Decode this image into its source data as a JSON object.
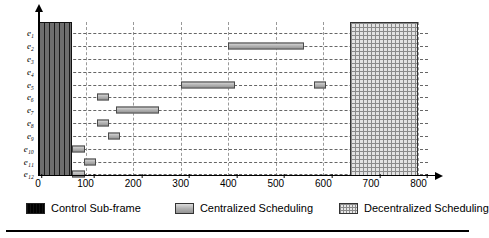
{
  "chart_data": {
    "type": "bar",
    "subtype": "horizontal-gantt",
    "title": "",
    "xlabel": "",
    "ylabel": "",
    "xlim": [
      0,
      820
    ],
    "ylim_categories": 12,
    "grid": true,
    "grid_style": "dashed",
    "legend_position": "bottom",
    "xticks": [
      0,
      100,
      200,
      300,
      400,
      500,
      600,
      700,
      800
    ],
    "xtick_labels": [
      "0",
      "100",
      "200",
      "300",
      "400",
      "500",
      "600",
      "700",
      "800"
    ],
    "categories": [
      "e1",
      "e2",
      "e3",
      "e4",
      "e5",
      "e6",
      "e7",
      "e8",
      "e9",
      "e10",
      "e11",
      "e12"
    ],
    "category_labels": [
      "e₁",
      "e₂",
      "e₃",
      "e₄",
      "e₅",
      "e₆",
      "e₇",
      "e₈",
      "e₉",
      "e₁₀",
      "e₁₁",
      "e₁₂"
    ],
    "series": [
      {
        "name": "Control Sub-frame",
        "style": "control",
        "color": "#1a1a1a",
        "spans_all_rows": true,
        "intervals": [
          {
            "start": 0,
            "end": 72
          }
        ]
      },
      {
        "name": "Centralized Scheduling",
        "style": "centralized",
        "color": "#a8a8a8",
        "spans_all_rows": false,
        "bars": [
          {
            "row": "e1",
            "intervals": []
          },
          {
            "row": "e2",
            "intervals": [
              {
                "start": 400,
                "end": 560
              }
            ]
          },
          {
            "row": "e3",
            "intervals": []
          },
          {
            "row": "e4",
            "intervals": []
          },
          {
            "row": "e5",
            "intervals": [
              {
                "start": 300,
                "end": 415
              },
              {
                "start": 580,
                "end": 605
              }
            ]
          },
          {
            "row": "e6",
            "intervals": [
              {
                "start": 125,
                "end": 150
              }
            ]
          },
          {
            "row": "e7",
            "intervals": [
              {
                "start": 165,
                "end": 255
              }
            ]
          },
          {
            "row": "e8",
            "intervals": [
              {
                "start": 125,
                "end": 150
              }
            ]
          },
          {
            "row": "e9",
            "intervals": [
              {
                "start": 148,
                "end": 172
              }
            ]
          },
          {
            "row": "e10",
            "intervals": [
              {
                "start": 72,
                "end": 98
              }
            ]
          },
          {
            "row": "e11",
            "intervals": [
              {
                "start": 96,
                "end": 122
              }
            ]
          },
          {
            "row": "e12",
            "intervals": [
              {
                "start": 72,
                "end": 98
              }
            ]
          }
        ]
      },
      {
        "name": "Decentralized Scheduling",
        "style": "decentralized",
        "color": "#e3e3e3",
        "spans_all_rows": true,
        "intervals": [
          {
            "start": 655,
            "end": 800
          }
        ]
      }
    ]
  },
  "legend": {
    "items": [
      {
        "label": "Control Sub-frame",
        "swatch": "control-swatch"
      },
      {
        "label": "Centralized Scheduling",
        "swatch": "centralized-swatch"
      },
      {
        "label": "Decentralized Scheduling",
        "swatch": "decentralized-swatch"
      }
    ]
  },
  "colors": {
    "axis": "#000000",
    "grid": "#666666",
    "control_fill": "#1a1a1a",
    "centralized_fill": "#a8a8a8",
    "decentralized_fill": "#e3e3e3",
    "background": "#ffffff"
  }
}
